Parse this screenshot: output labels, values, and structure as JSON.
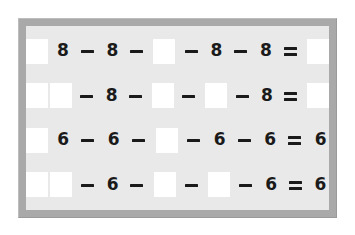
{
  "document": {
    "title": "Arithmetic Worksheet Puzzle",
    "frame_color": "#a9a9a9",
    "panel_color": "#e9e9e9",
    "blank_color": "#ffffff",
    "ink_color": "#1a1a1a"
  },
  "glyphs": {
    "minus": "−",
    "equals": "=",
    "blank": ""
  },
  "rows": [
    {
      "id": "row-1",
      "tokens": [
        {
          "type": "blank",
          "text": ""
        },
        {
          "type": "digit",
          "text": "8"
        },
        {
          "type": "minus",
          "text": "−"
        },
        {
          "type": "digit",
          "text": "8"
        },
        {
          "type": "minus",
          "text": "−"
        },
        {
          "type": "blank",
          "text": ""
        },
        {
          "type": "minus",
          "text": "−"
        },
        {
          "type": "digit",
          "text": "8"
        },
        {
          "type": "minus",
          "text": "−"
        },
        {
          "type": "digit",
          "text": "8"
        },
        {
          "type": "equals",
          "text": "="
        },
        {
          "type": "blank",
          "text": ""
        }
      ]
    },
    {
      "id": "row-2",
      "tokens": [
        {
          "type": "blank",
          "text": ""
        },
        {
          "type": "blank",
          "text": ""
        },
        {
          "type": "minus",
          "text": "−"
        },
        {
          "type": "digit",
          "text": "8"
        },
        {
          "type": "minus",
          "text": "−"
        },
        {
          "type": "blank",
          "text": ""
        },
        {
          "type": "minus",
          "text": "−"
        },
        {
          "type": "blank",
          "text": ""
        },
        {
          "type": "minus",
          "text": "−"
        },
        {
          "type": "digit",
          "text": "8"
        },
        {
          "type": "equals",
          "text": "="
        },
        {
          "type": "blank",
          "text": ""
        }
      ]
    },
    {
      "id": "row-3",
      "tokens": [
        {
          "type": "blank",
          "text": ""
        },
        {
          "type": "digit",
          "text": "6"
        },
        {
          "type": "minus",
          "text": "−"
        },
        {
          "type": "digit",
          "text": "6"
        },
        {
          "type": "minus",
          "text": "−"
        },
        {
          "type": "blank",
          "text": ""
        },
        {
          "type": "minus",
          "text": "−"
        },
        {
          "type": "digit",
          "text": "6"
        },
        {
          "type": "minus",
          "text": "−"
        },
        {
          "type": "digit",
          "text": "6"
        },
        {
          "type": "equals",
          "text": "="
        },
        {
          "type": "digit",
          "text": "6"
        }
      ]
    },
    {
      "id": "row-4",
      "tokens": [
        {
          "type": "blank",
          "text": ""
        },
        {
          "type": "blank",
          "text": ""
        },
        {
          "type": "minus",
          "text": "−"
        },
        {
          "type": "digit",
          "text": "6"
        },
        {
          "type": "minus",
          "text": "−"
        },
        {
          "type": "blank",
          "text": ""
        },
        {
          "type": "minus",
          "text": "−"
        },
        {
          "type": "blank",
          "text": ""
        },
        {
          "type": "minus",
          "text": "−"
        },
        {
          "type": "digit",
          "text": "6"
        },
        {
          "type": "equals",
          "text": "="
        },
        {
          "type": "digit",
          "text": "6"
        }
      ]
    }
  ]
}
